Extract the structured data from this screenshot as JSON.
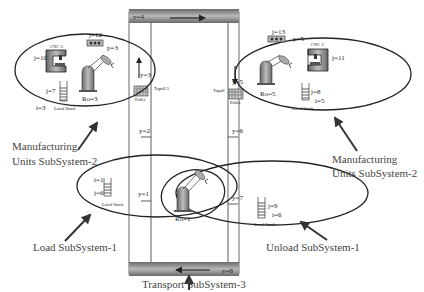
{
  "diagram": {
    "conveyor": {
      "top_label": "y=4",
      "bottom_label": "y=8",
      "left_positions": [
        "y=3",
        "y=2",
        "y=1"
      ],
      "right_positions": [
        "y=5",
        "y=6",
        "y=7"
      ],
      "left_station_label": "Topall 3",
      "right_station_label": "Topall",
      "pallet_label": "Pallet"
    },
    "manufacturing_left": {
      "cnc_label": "CNC 3",
      "cnc_id": "j=10",
      "buffer_id": "j=12",
      "buffer_p": "p=3",
      "robot_label": "Ro=3",
      "stock_id": "j=7",
      "stock_i": "i=3",
      "stock_label": "Local Stock"
    },
    "manufacturing_right": {
      "cnc_label": "CNC 2",
      "cnc_id": "j=11",
      "buffer_id": "j=13",
      "buffer_p": "p=5",
      "robot_label": "Ro=5",
      "stock_id": "j=8",
      "stock_i": "i=5",
      "stock_label": "Local Stock"
    },
    "load": {
      "stock_i": "i=1",
      "stock_id": "j=6",
      "stock_label": "Local Stock"
    },
    "unload": {
      "stock_id": "j=9",
      "stock_i": "i=6",
      "stock_label": "Local Stock"
    },
    "shared_robot_label": "Ro=1",
    "callouts": {
      "mfg_left_line1": "Manufacturing",
      "mfg_left_line2": "Units SubSystem-2",
      "mfg_right_line1": "Manufacturing",
      "mfg_right_line2": "Units SubSystem-2",
      "load": "Load SubSystem-1",
      "unload": "Unload SubSystem-1",
      "transport": "Transport SubSystem-3"
    }
  }
}
